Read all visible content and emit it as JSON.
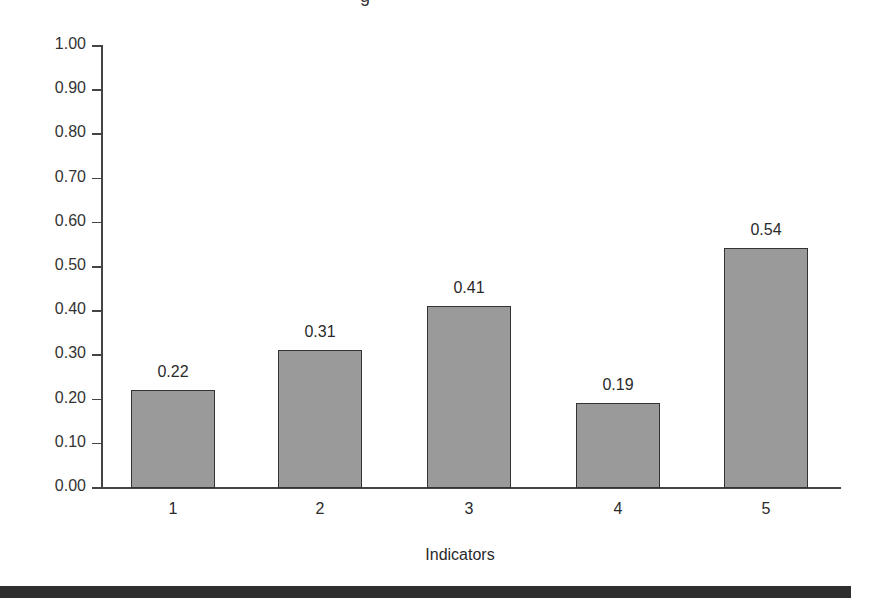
{
  "chart_data": {
    "type": "bar",
    "title": "",
    "categories": [
      "1",
      "2",
      "3",
      "4",
      "5"
    ],
    "values": [
      0.22,
      0.31,
      0.41,
      0.19,
      0.54
    ],
    "value_labels": [
      "0.22",
      "0.31",
      "0.41",
      "0.19",
      "0.54"
    ],
    "xlabel": "Indicators",
    "ylabel": "",
    "ylim": [
      0,
      1.0
    ],
    "yticks": [
      "0.00",
      "0.10",
      "0.20",
      "0.30",
      "0.40",
      "0.50",
      "0.60",
      "0.70",
      "0.80",
      "0.90",
      "1.00"
    ],
    "grid": false,
    "legend": null,
    "bar_color": "#9a9a9a",
    "bar_edge_color": "#333333"
  }
}
